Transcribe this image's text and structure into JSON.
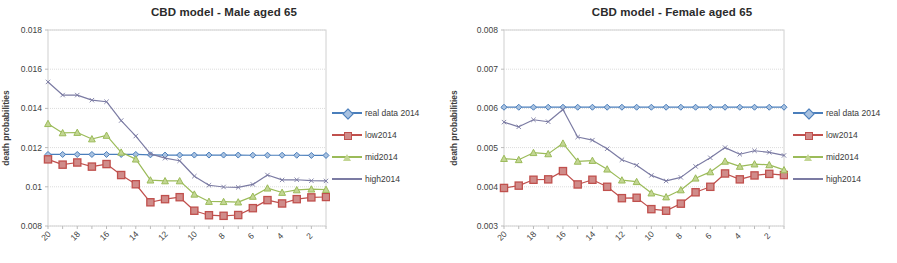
{
  "page": {
    "background": "#ffffff",
    "width": 897,
    "height": 263
  },
  "series_styles": {
    "real data 2014": {
      "color": "#4a7ebb",
      "marker": "diamond"
    },
    "low2014": {
      "color": "#c0504d",
      "marker": "square"
    },
    "mid2014": {
      "color": "#9bbb59",
      "marker": "triangle"
    },
    "high2014": {
      "color": "#7b7ba3",
      "marker": "none"
    }
  },
  "panels": [
    {
      "id": "male",
      "title": "CBD model - Male aged 65",
      "legend": [
        {
          "label": "real data 2014"
        },
        {
          "label": "low2014"
        },
        {
          "label": "mid2014"
        },
        {
          "label": "high2014"
        }
      ]
    },
    {
      "id": "female",
      "title": "CBD model - Female aged 65",
      "legend": [
        {
          "label": "real data 2014"
        },
        {
          "label": "low2014"
        },
        {
          "label": "mid2014"
        },
        {
          "label": "high2014"
        }
      ]
    }
  ],
  "chart_data": [
    {
      "id": "male",
      "type": "line",
      "title": "CBD model - Male aged 65",
      "xlabel": "",
      "ylabel": "death probabilities",
      "x": [
        20,
        19,
        18,
        17,
        16,
        15,
        14,
        13,
        12,
        11,
        10,
        9,
        8,
        7,
        6,
        5,
        4,
        3,
        2,
        1
      ],
      "xtick_labels": [
        "20",
        "",
        "18",
        "",
        "16",
        "",
        "14",
        "",
        "12",
        "",
        "10",
        "",
        "8",
        "",
        "6",
        "",
        "4",
        "",
        "2",
        ""
      ],
      "ylim": [
        0.008,
        0.018
      ],
      "yticks": [
        0.008,
        0.01,
        0.012,
        0.014,
        0.016,
        0.018
      ],
      "ytick_labels": [
        "0.008",
        "0.01",
        "0.012",
        "0.014",
        "0.016",
        "0.018"
      ],
      "grid": true,
      "legend_position": "right",
      "series": [
        {
          "name": "real data 2014",
          "values": [
            0.01165,
            0.01165,
            0.01165,
            0.01165,
            0.01165,
            0.01165,
            0.01165,
            0.01163,
            0.01162,
            0.01162,
            0.01162,
            0.01162,
            0.01162,
            0.01162,
            0.01161,
            0.01161,
            0.01161,
            0.01161,
            0.0116,
            0.0116
          ]
        },
        {
          "name": "low2014",
          "values": [
            0.0114,
            0.01113,
            0.01124,
            0.01103,
            0.01116,
            0.0106,
            0.01013,
            0.00921,
            0.00937,
            0.00947,
            0.00878,
            0.00855,
            0.00852,
            0.00856,
            0.00891,
            0.00932,
            0.00915,
            0.00937,
            0.00946,
            0.00948
          ]
        },
        {
          "name": "mid2014",
          "values": [
            0.01322,
            0.01275,
            0.01277,
            0.01244,
            0.01262,
            0.01176,
            0.01141,
            0.01034,
            0.0103,
            0.0103,
            0.00962,
            0.00925,
            0.00924,
            0.00922,
            0.00951,
            0.00993,
            0.00971,
            0.00984,
            0.00988,
            0.00986
          ]
        },
        {
          "name": "high2014",
          "values": [
            0.01535,
            0.01468,
            0.01468,
            0.01442,
            0.01434,
            0.01338,
            0.01259,
            0.01168,
            0.01146,
            0.01133,
            0.01054,
            0.01008,
            0.00999,
            0.00997,
            0.01012,
            0.0106,
            0.01035,
            0.01036,
            0.01031,
            0.0103
          ]
        }
      ]
    },
    {
      "id": "female",
      "type": "line",
      "title": "CBD model - Female aged 65",
      "xlabel": "",
      "ylabel": "death probabilities",
      "x": [
        20,
        19,
        18,
        17,
        16,
        15,
        14,
        13,
        12,
        11,
        10,
        9,
        8,
        7,
        6,
        5,
        4,
        3,
        2,
        1
      ],
      "xtick_labels": [
        "20",
        "",
        "18",
        "",
        "16",
        "",
        "14",
        "",
        "12",
        "",
        "10",
        "",
        "8",
        "",
        "6",
        "",
        "4",
        "",
        "2",
        ""
      ],
      "ylim": [
        0.003,
        0.008
      ],
      "yticks": [
        0.003,
        0.004,
        0.005,
        0.006,
        0.007,
        0.008
      ],
      "ytick_labels": [
        "0.003",
        "0.004",
        "0.005",
        "0.006",
        "0.007",
        "0.008"
      ],
      "grid": true,
      "legend_position": "right",
      "series": [
        {
          "name": "real data 2014",
          "values": [
            0.00603,
            0.00603,
            0.00603,
            0.00603,
            0.00603,
            0.00603,
            0.00603,
            0.00603,
            0.00603,
            0.00603,
            0.00603,
            0.00603,
            0.00603,
            0.00603,
            0.00603,
            0.00603,
            0.00603,
            0.00603,
            0.00603,
            0.00603
          ]
        },
        {
          "name": "low2014",
          "values": [
            0.00397,
            0.00403,
            0.00418,
            0.00419,
            0.0044,
            0.00406,
            0.00418,
            0.004,
            0.00371,
            0.00372,
            0.00343,
            0.00339,
            0.00357,
            0.00386,
            0.004,
            0.00434,
            0.00419,
            0.00429,
            0.00433,
            0.0043
          ]
        },
        {
          "name": "mid2014",
          "values": [
            0.00472,
            0.00469,
            0.00487,
            0.00484,
            0.00511,
            0.00465,
            0.00467,
            0.00445,
            0.00417,
            0.00413,
            0.00384,
            0.00374,
            0.00392,
            0.00422,
            0.00438,
            0.00465,
            0.00452,
            0.00458,
            0.00456,
            0.00443
          ]
        },
        {
          "name": "high2014",
          "values": [
            0.00565,
            0.00553,
            0.00571,
            0.00566,
            0.00597,
            0.00527,
            0.00519,
            0.00497,
            0.00469,
            0.00455,
            0.00429,
            0.00415,
            0.00424,
            0.00452,
            0.00474,
            0.005,
            0.00483,
            0.00492,
            0.00488,
            0.0048
          ]
        }
      ]
    }
  ]
}
